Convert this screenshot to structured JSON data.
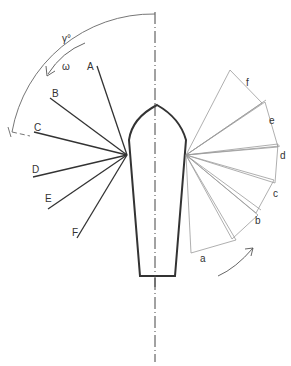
{
  "diagram": {
    "colors": {
      "heavy": "#333333",
      "light": "#9a9a9a",
      "arc": "#666666"
    },
    "angle_label": "γ°",
    "angular_velocity_label": "ω",
    "left_lines": [
      {
        "label": "A",
        "x2": 97,
        "y2": 66,
        "lx": 87,
        "ly": 70
      },
      {
        "label": "B",
        "x2": 50,
        "y2": 98,
        "lx": 52,
        "ly": 97
      },
      {
        "label": "C",
        "x2": 34,
        "y2": 132,
        "lx": 34,
        "ly": 131
      },
      {
        "label": "D",
        "x2": 33,
        "y2": 177,
        "lx": 32,
        "ly": 173
      },
      {
        "label": "E",
        "x2": 48,
        "y2": 209,
        "lx": 45,
        "ly": 202
      },
      {
        "label": "F",
        "x2": 77,
        "y2": 238,
        "lx": 72,
        "ly": 234
      }
    ],
    "right_labels": [
      {
        "label": "a",
        "x": 203,
        "y": 260
      },
      {
        "label": "b",
        "x": 256,
        "y": 223
      },
      {
        "label": "c",
        "x": 274,
        "y": 196
      },
      {
        "label": "d",
        "x": 280,
        "y": 158
      },
      {
        "label": "e",
        "x": 270,
        "y": 123
      },
      {
        "label": "f",
        "x": 248,
        "y": 86
      }
    ]
  }
}
